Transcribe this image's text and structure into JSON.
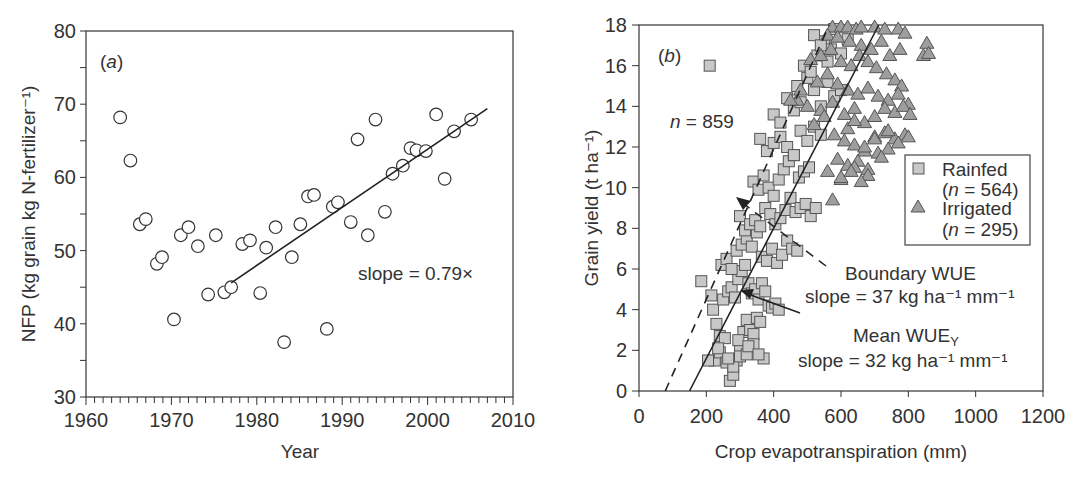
{
  "chart_data": [
    {
      "type": "scatter",
      "panel_label": "(a)",
      "title": "",
      "xlabel": "Year",
      "ylabel": "NFP (kg grain kg N-fertilizer⁻¹)",
      "xlim": [
        1960,
        2010
      ],
      "ylim": [
        30,
        80
      ],
      "xticks": [
        1960,
        1970,
        1980,
        1990,
        2000,
        2010
      ],
      "yticks": [
        30,
        40,
        50,
        60,
        70,
        80
      ],
      "grid": false,
      "marker": "open-circle",
      "series": [
        {
          "name": "NFP",
          "x": [
            1964.0,
            1965.2,
            1966.3,
            1967.0,
            1968.3,
            1968.9,
            1970.3,
            1971.1,
            1972.0,
            1973.1,
            1974.3,
            1975.2,
            1976.2,
            1977.0,
            1978.3,
            1979.2,
            1980.4,
            1981.1,
            1982.2,
            1983.2,
            1984.1,
            1985.1,
            1986.0,
            1986.7,
            1988.2,
            1988.9,
            1989.5,
            1991.0,
            1991.8,
            1993.0,
            1993.9,
            1995.0,
            1995.9,
            1997.1,
            1998.0,
            1998.7,
            1999.8,
            2001.0,
            2002.0,
            2003.1,
            2005.1
          ],
          "y": [
            68.2,
            62.3,
            53.6,
            54.3,
            48.2,
            49.1,
            40.6,
            52.1,
            53.2,
            50.6,
            44.0,
            52.1,
            44.3,
            45.0,
            50.9,
            51.4,
            44.2,
            50.4,
            53.2,
            37.5,
            49.1,
            53.6,
            57.4,
            57.6,
            39.3,
            56.0,
            56.6,
            53.9,
            65.2,
            52.1,
            67.9,
            55.3,
            60.5,
            61.6,
            64.0,
            63.7,
            63.6,
            68.6,
            59.8,
            66.3,
            67.9
          ]
        }
      ],
      "trend_line": {
        "x": [
          1977.0,
          2007.0
        ],
        "y": [
          45.6,
          69.4
        ]
      },
      "annotations": [
        "slope = 0.79×"
      ]
    },
    {
      "type": "scatter",
      "panel_label": "(b)",
      "title": "",
      "xlabel": "Crop evapotranspiration (mm)",
      "ylabel": "Grain yield (t ha⁻¹)",
      "xlim": [
        0,
        1200
      ],
      "ylim": [
        0,
        18
      ],
      "xticks": [
        0,
        200,
        400,
        600,
        800,
        1000,
        1200
      ],
      "yticks": [
        0,
        2,
        4,
        6,
        8,
        10,
        12,
        14,
        16,
        18
      ],
      "grid": false,
      "legend": {
        "position": "right-middle",
        "entries": [
          {
            "label": "Rainfed",
            "sub": "(n = 564)",
            "marker": "square"
          },
          {
            "label": "Irrigated",
            "sub": "(n = 295)",
            "marker": "triangle"
          }
        ]
      },
      "series": [
        {
          "name": "Rainfed",
          "marker": "square",
          "n": 564,
          "x": [
            185,
            215,
            220,
            230,
            240,
            255,
            262,
            270,
            280,
            290,
            300,
            310,
            320,
            330,
            340,
            350,
            360,
            370,
            250,
            265,
            275,
            285,
            295,
            305,
            315,
            325,
            335,
            345,
            355,
            365,
            375,
            385,
            395,
            405,
            415,
            245,
            260,
            275,
            290,
            305,
            320,
            335,
            350,
            365,
            380,
            395,
            410,
            425,
            440,
            455,
            470,
            300,
            315,
            330,
            345,
            360,
            375,
            390,
            405,
            420,
            435,
            450,
            465,
            480,
            495,
            510,
            525,
            340,
            355,
            370,
            385,
            400,
            415,
            430,
            445,
            460,
            475,
            490,
            505,
            360,
            380,
            400,
            420,
            440,
            460,
            480,
            500,
            520,
            540,
            400,
            420,
            440,
            460,
            480,
            500,
            520,
            540,
            560,
            580,
            600,
            470,
            490,
            510,
            530,
            550,
            570,
            520,
            540,
            560,
            580,
            600,
            620,
            210,
            225,
            240,
            260,
            280,
            300,
            320,
            340,
            205,
            235,
            265,
            295,
            325,
            355
          ],
          "y": [
            5.4,
            4.7,
            4.0,
            3.3,
            2.7,
            2.6,
            1.5,
            0.5,
            0.8,
            1.5,
            2.0,
            2.9,
            3.5,
            3.0,
            2.8,
            3.6,
            3.4,
            1.6,
            4.5,
            4.9,
            5.1,
            4.6,
            5.5,
            5.9,
            6.2,
            5.3,
            4.8,
            5.0,
            4.5,
            5.3,
            4.9,
            4.2,
            4.1,
            4.3,
            4.0,
            6.2,
            6.5,
            6.0,
            6.9,
            7.2,
            7.5,
            7.1,
            7.8,
            6.6,
            6.4,
            7.0,
            6.3,
            6.7,
            7.4,
            7.0,
            6.9,
            8.6,
            7.9,
            8.2,
            8.4,
            8.1,
            9.0,
            8.7,
            8.2,
            8.5,
            8.9,
            9.5,
            8.8,
            9.0,
            9.2,
            8.6,
            9.0,
            10.3,
            9.9,
            10.6,
            10.0,
            9.6,
            10.4,
            10.9,
            11.3,
            11.6,
            10.5,
            10.8,
            11.0,
            12.4,
            11.8,
            12.2,
            12.5,
            12.0,
            11.6,
            12.8,
            12.3,
            13.0,
            12.6,
            13.6,
            13.2,
            14.4,
            13.8,
            14.2,
            15.4,
            14.8,
            14.0,
            15.2,
            14.5,
            14.8,
            15.0,
            16.0,
            15.7,
            16.5,
            17.2,
            16.8,
            17.5,
            17.0,
            16.2,
            17.8,
            16.6,
            17.3,
            16.0,
            1.5,
            1.9,
            1.4,
            1.2,
            1.7,
            1.8,
            2.3,
            1.5,
            2.1,
            1.6,
            2.5,
            2.2,
            1.8,
            1.4
          ]
        },
        {
          "name": "Irrigated",
          "marker": "triangle",
          "n": 295,
          "x": [
            575,
            600,
            620,
            645,
            660,
            700,
            730,
            770,
            790,
            560,
            590,
            625,
            660,
            690,
            720,
            745,
            775,
            510,
            540,
            570,
            600,
            630,
            655,
            680,
            705,
            735,
            760,
            780,
            530,
            560,
            590,
            620,
            650,
            680,
            710,
            740,
            770,
            800,
            470,
            500,
            540,
            575,
            610,
            640,
            670,
            700,
            730,
            760,
            785,
            805,
            580,
            610,
            640,
            670,
            700,
            730,
            760,
            790,
            590,
            620,
            650,
            680,
            710,
            740,
            560,
            600,
            640,
            680,
            720,
            600,
            630,
            660,
            575,
            855,
            845,
            860,
            450,
            480,
            520,
            550,
            620,
            640,
            670,
            700,
            740,
            770,
            800
          ],
          "y": [
            17.9,
            17.9,
            17.9,
            17.8,
            17.9,
            17.9,
            17.8,
            17.8,
            17.6,
            17.5,
            17.4,
            17.2,
            17.0,
            16.8,
            17.2,
            16.5,
            16.8,
            16.3,
            16.5,
            16.8,
            16.2,
            16.0,
            16.5,
            16.2,
            15.9,
            15.6,
            15.3,
            15.0,
            15.2,
            15.6,
            15.1,
            14.8,
            14.6,
            14.9,
            14.5,
            14.3,
            14.6,
            14.1,
            14.3,
            14.0,
            13.8,
            14.2,
            13.6,
            13.9,
            13.2,
            13.5,
            13.9,
            13.7,
            14.0,
            13.6,
            12.6,
            12.3,
            12.1,
            11.8,
            12.5,
            12.7,
            12.4,
            12.6,
            11.4,
            11.1,
            11.3,
            10.9,
            11.7,
            11.9,
            10.8,
            10.4,
            11.0,
            10.6,
            11.5,
            10.5,
            10.8,
            10.3,
            9.4,
            17.1,
            16.5,
            16.6,
            14.3,
            14.8,
            13.1,
            13.5,
            12.9,
            13.3,
            12.0,
            12.4,
            12.8,
            12.2,
            12.5
          ]
        }
      ],
      "lines": [
        {
          "name": "Boundary WUE",
          "style": "dashed",
          "x": [
            78,
            565
          ],
          "y": [
            0,
            18
          ],
          "slope_kg_ha_mm": 37
        },
        {
          "name": "Mean WUEY",
          "style": "solid",
          "x": [
            150,
            712
          ],
          "y": [
            0,
            18
          ],
          "slope_kg_ha_mm": 32
        }
      ],
      "annotations": [
        "n = 859",
        "Boundary WUE",
        "slope = 37 kg ha⁻¹ mm⁻¹",
        "Mean WUE",
        "slope = 32 kg ha⁻¹ mm⁻¹"
      ]
    }
  ],
  "panel_a": {
    "label_open": "(",
    "label_letter": "a",
    "label_close": ")",
    "xlabel": "Year",
    "ylabel": "NFP (kg grain kg N-fertilizer⁻¹)",
    "slope_text": "slope = 0.79×"
  },
  "panel_b": {
    "label_open": "(",
    "label_letter": "b",
    "label_close": ")",
    "xlabel": "Crop evapotranspiration (mm)",
    "ylabel": "Grain yield (t ha⁻¹)",
    "n_italic": "n",
    "n_text": " = 859",
    "legend": {
      "rainfed": "Rainfed",
      "rainfed_n_open": "(",
      "rainfed_n_text": " = 564)",
      "irrigated": "Irrigated",
      "irrigated_n_open": "(",
      "irrigated_n_text": " = 295)",
      "n_italic": "n"
    },
    "boundary_title": "Boundary WUE",
    "boundary_slope": "slope = 37 kg ha⁻¹ mm⁻¹",
    "mean_title": "Mean WUE",
    "mean_sub": "Y",
    "mean_slope": "slope = 32 kg ha⁻¹ mm⁻¹"
  },
  "colors": {
    "axis": "#333333",
    "rainfed_fill": "#c8c8c8",
    "irrigated_fill": "#9e9e9e",
    "marker_stroke": "#555555"
  }
}
